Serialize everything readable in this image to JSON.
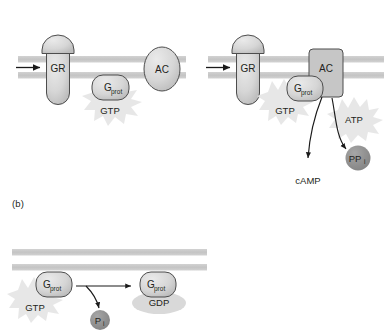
{
  "figure": {
    "panels": [
      {
        "id": "a",
        "label": "",
        "sub_panels": [
          {
            "id": "a-left",
            "caption": "inactive state",
            "elements": {
              "receptor_label": "GR",
              "gprotein_label": "G",
              "gprotein_sub": "prot",
              "nucleotide_label": "GTP",
              "effector_label": "AC"
            }
          },
          {
            "id": "a-right",
            "caption": "activated state",
            "elements": {
              "receptor_label": "GR",
              "gprotein_label": "G",
              "gprotein_sub": "prot",
              "nucleotide_label": "GTP",
              "effector_label": "AC",
              "substrate_label": "ATP",
              "byproduct_label": "PP",
              "byproduct_sub": "i",
              "product_label": "cAMP"
            }
          }
        ]
      },
      {
        "id": "b",
        "label": "(b)",
        "elements": {
          "gprotein_left_label": "G",
          "gprotein_left_sub": "prot",
          "nucleotide_bound_label": "GTP",
          "gprotein_right_label": "G",
          "gprotein_right_sub": "prot",
          "nucleotide_product_label": "GDP",
          "phosphate_label": "P",
          "phosphate_sub": "i"
        }
      }
    ]
  },
  "colors": {
    "membrane": "#c9c9c9",
    "protein_fill": "#d4d4d4",
    "protein_stroke": "#4d4d4d",
    "effector_fill": "#c6c6c6",
    "starburst_fill": "#e3e3e3",
    "dark_circle_fill": "#8c8c8c",
    "gdp_ellipse_fill": "#d9d9d9",
    "text": "#231f20",
    "arrow": "#1a1a1a",
    "background": "#ffffff"
  }
}
